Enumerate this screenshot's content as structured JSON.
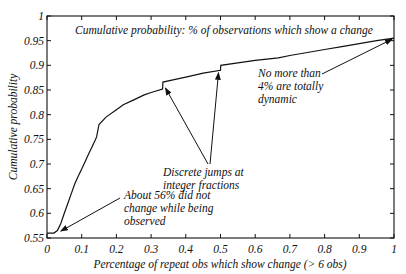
{
  "chart_data": {
    "type": "line",
    "title": "Cumulative probability:  % of observations which show a change",
    "xlabel": "Percentage of repeat obs which show change (> 6 obs)",
    "ylabel": "Cumulative probability",
    "xlim": [
      0,
      1
    ],
    "ylim": [
      0.55,
      1
    ],
    "grid": false,
    "x_ticks": [
      "0",
      "0.1",
      "0.2",
      "0.3",
      "0.4",
      "0.5",
      "0.6",
      "0.7",
      "0.8",
      "0.9",
      "1"
    ],
    "y_ticks": [
      "0.55",
      "0.6",
      "0.65",
      "0.7",
      "0.75",
      "0.8",
      "0.85",
      "0.9",
      "0.95",
      "1"
    ],
    "series": [
      {
        "name": "Cumulative probability",
        "x": [
          0,
          0.02,
          0.03,
          0.04,
          0.05,
          0.06,
          0.07,
          0.08,
          0.09,
          0.1,
          0.11,
          0.12,
          0.13,
          0.14,
          0.143,
          0.15,
          0.17,
          0.2,
          0.22,
          0.25,
          0.28,
          0.3,
          0.333,
          0.334,
          0.36,
          0.4,
          0.45,
          0.5,
          0.501,
          0.55,
          0.6,
          0.667,
          0.7,
          0.75,
          0.8,
          0.85,
          0.9,
          0.95,
          1.0
        ],
        "values": [
          0.56,
          0.56,
          0.565,
          0.58,
          0.6,
          0.62,
          0.64,
          0.66,
          0.675,
          0.69,
          0.705,
          0.72,
          0.735,
          0.75,
          0.755,
          0.78,
          0.795,
          0.81,
          0.82,
          0.83,
          0.84,
          0.845,
          0.852,
          0.866,
          0.87,
          0.876,
          0.884,
          0.89,
          0.9,
          0.905,
          0.91,
          0.915,
          0.92,
          0.926,
          0.932,
          0.938,
          0.944,
          0.95,
          0.955
        ]
      }
    ],
    "annotations": [
      {
        "text": [
          "About 56% did not",
          "change while being",
          "observed"
        ],
        "points_to": [
          0.04,
          0.562
        ]
      },
      {
        "text": [
          "Discrete jumps at",
          "integer fractions"
        ],
        "points_to": [
          [
            0.33,
            0.86
          ],
          [
            0.5,
            0.895
          ]
        ]
      },
      {
        "text": [
          "No more than",
          "4% are totally",
          "dynamic"
        ],
        "points_to": [
          1.0,
          0.955
        ]
      }
    ]
  }
}
